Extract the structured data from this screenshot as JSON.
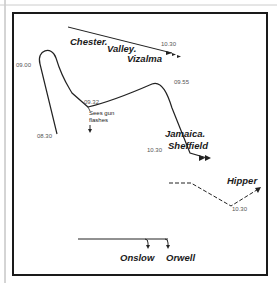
{
  "colors": {
    "frame": "#1a1a1a",
    "track": "#222222",
    "time": "#555555",
    "outer_line": "#aaaaaa"
  },
  "ships": {
    "chester": "Chester.",
    "valley": "Valley.",
    "vizalma": "Vizalma",
    "jamaica": "Jamaica.",
    "sheffield": "Sheffield",
    "hipper": "Hipper",
    "onslow": "Onslow",
    "orwell": "Orwell"
  },
  "times": {
    "t0830": "08.30",
    "t0900": "09.00",
    "t0932": "09.32",
    "t0955": "09.55",
    "t1030_main": "10.30",
    "t1030_convoy": "10.30",
    "t1030_hipper": "10.30"
  },
  "notes": {
    "gun_flashes_line1": "Sees gun",
    "gun_flashes_line2": "flashes"
  },
  "icons": {
    "arrow": "arrowhead-icon",
    "hipper_track": "dashed-track-icon"
  }
}
